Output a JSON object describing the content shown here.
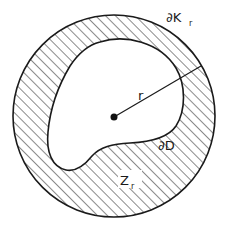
{
  "figure": {
    "type": "diagram",
    "colors": {
      "stroke": "#1a1a1a",
      "hatch": "#2a2a2a",
      "background": "#ffffff",
      "inner_fill": "#ffffff"
    },
    "outer_circle": {
      "cx": 114,
      "cy": 116,
      "r": 101
    },
    "center_point": {
      "cx": 114,
      "cy": 117,
      "r": 3.5
    },
    "radius_line": {
      "x1": 114,
      "y1": 117,
      "x2": 201,
      "y2": 66
    },
    "hatch": {
      "angle_deg": 45,
      "spacing": 7
    }
  },
  "labels": {
    "boundary_K": {
      "main": "∂K",
      "sub": "r"
    },
    "radius": {
      "main": "r"
    },
    "boundary_D": {
      "main": "∂D"
    },
    "region_Z": {
      "main": "Z",
      "sub": "r"
    }
  }
}
